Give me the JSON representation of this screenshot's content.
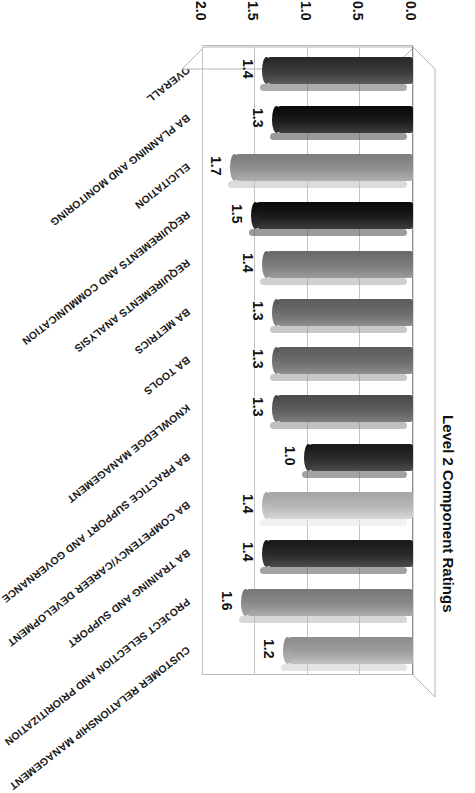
{
  "chart_data": {
    "type": "bar",
    "orientation": "horizontal",
    "title": "Level 2 Component Ratings",
    "xlabel": "",
    "ylabel": "",
    "xlim": [
      0.0,
      2.0
    ],
    "xticks": [
      "0.0",
      "0.5",
      "1.0",
      "1.5",
      "2.0"
    ],
    "grid": true,
    "legend": "none",
    "rotation_note": "chart rendered upside-down (180 degrees) in source image",
    "categories": [
      "OVERALL",
      "BA PLANNING AND MONITORING",
      "ELICITATION",
      "REQUIREMENTS AND COMMUNICATION",
      "REQUIREMENTS ANALYSIS",
      "BA METRICS",
      "BA TOOLS",
      "KNOWLEDGE MANAGEMENT",
      "BA PRACTICE SUPPORT AND GOVERNANCE",
      "BA COMPETENCY/CAREER DEVELOPMENT",
      "BA TRAINING AND SUPPORT",
      "PROJECT SELECTION AND PRIORITIZATION",
      "CUSTOMER RELATIONSHIP MANAGEMENT"
    ],
    "values": [
      1.4,
      1.3,
      1.7,
      1.5,
      1.4,
      1.3,
      1.3,
      1.3,
      1.0,
      1.4,
      1.4,
      1.6,
      1.2
    ],
    "data_labels": [
      "1.4",
      "1.3",
      "1.7",
      "1.5",
      "1.4",
      "1.3",
      "1.3",
      "1.3",
      "1.0",
      "1.4",
      "1.4",
      "1.6",
      "1.2"
    ],
    "bar_colors": [
      "#3a3a3a",
      "#1b1b1b",
      "#8f8f8f",
      "#1b1b1b",
      "#7b7b7b",
      "#6d6d6d",
      "#6d6d6d",
      "#5c5c5c",
      "#2a2a2a",
      "#b7b7b7",
      "#2a2a2a",
      "#8a8a8a",
      "#9e9e9e",
      "#bcbcbc"
    ]
  },
  "axis": {
    "tick_labels": [
      "0.0",
      "0.5",
      "1.0",
      "1.5",
      "2.0"
    ]
  }
}
